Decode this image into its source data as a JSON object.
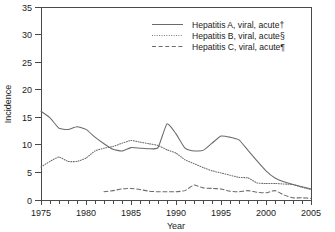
{
  "chart_data": {
    "type": "line",
    "title": "",
    "xlabel": "Year",
    "ylabel": "Incidence",
    "xlim": [
      1975,
      2005
    ],
    "ylim": [
      0,
      35
    ],
    "ytick_step": 5,
    "yticks": [
      0,
      5,
      10,
      15,
      20,
      25,
      30,
      35
    ],
    "xticks": [
      1975,
      1980,
      1985,
      1990,
      1995,
      2000,
      2005
    ],
    "xtick_labels": [
      "1975",
      "1980",
      "1985",
      "1990",
      "1995",
      "2000",
      "2005"
    ],
    "ytick_labels": [
      "0",
      "5",
      "10",
      "15",
      "20",
      "25",
      "30",
      "35"
    ],
    "x_minor_tick_interval": 1,
    "grid": false,
    "legend_position": "top-right",
    "x": [
      1975,
      1976,
      1977,
      1978,
      1979,
      1980,
      1981,
      1982,
      1983,
      1984,
      1985,
      1986,
      1987,
      1988,
      1989,
      1990,
      1991,
      1992,
      1993,
      1994,
      1995,
      1996,
      1997,
      1998,
      1999,
      2000,
      2001,
      2002,
      2003,
      2004,
      2005
    ],
    "series": [
      {
        "name": "Hepatitis A, viral, acute†",
        "style": "solid",
        "values": [
          16.1,
          14.9,
          13.0,
          12.8,
          13.3,
          12.8,
          11.4,
          10.2,
          9.2,
          8.9,
          9.5,
          9.4,
          9.3,
          9.5,
          13.8,
          12.0,
          9.4,
          8.9,
          9.0,
          10.3,
          11.6,
          11.4,
          10.9,
          9.0,
          7.1,
          5.3,
          4.0,
          3.3,
          2.8,
          2.4,
          2.0
        ]
      },
      {
        "name": "Hepatitis B, viral, acute§",
        "style": "dotted",
        "values": [
          6.0,
          7.0,
          7.8,
          7.0,
          7.0,
          7.6,
          8.9,
          9.4,
          9.7,
          10.3,
          10.8,
          10.5,
          10.2,
          9.9,
          9.1,
          8.5,
          7.3,
          6.6,
          5.9,
          5.3,
          4.9,
          4.5,
          4.1,
          4.0,
          3.1,
          3.0,
          3.0,
          2.9,
          2.8,
          2.3,
          1.9
        ]
      },
      {
        "name": "Hepatitis C, viral, acute¶",
        "style": "dashed",
        "values": [
          null,
          null,
          null,
          null,
          null,
          null,
          null,
          1.5,
          1.7,
          2.0,
          2.1,
          1.9,
          1.6,
          1.5,
          1.5,
          1.5,
          1.7,
          2.7,
          2.2,
          2.1,
          2.0,
          1.6,
          1.5,
          1.7,
          1.4,
          1.3,
          1.7,
          0.9,
          0.4,
          0.4,
          0.3
        ]
      }
    ]
  },
  "legend": {
    "entries": [
      {
        "label": "Hepatitis A, viral, acute†"
      },
      {
        "label": "Hepatitis B, viral, acute§"
      },
      {
        "label": "Hepatitis C, viral, acute¶"
      }
    ]
  }
}
